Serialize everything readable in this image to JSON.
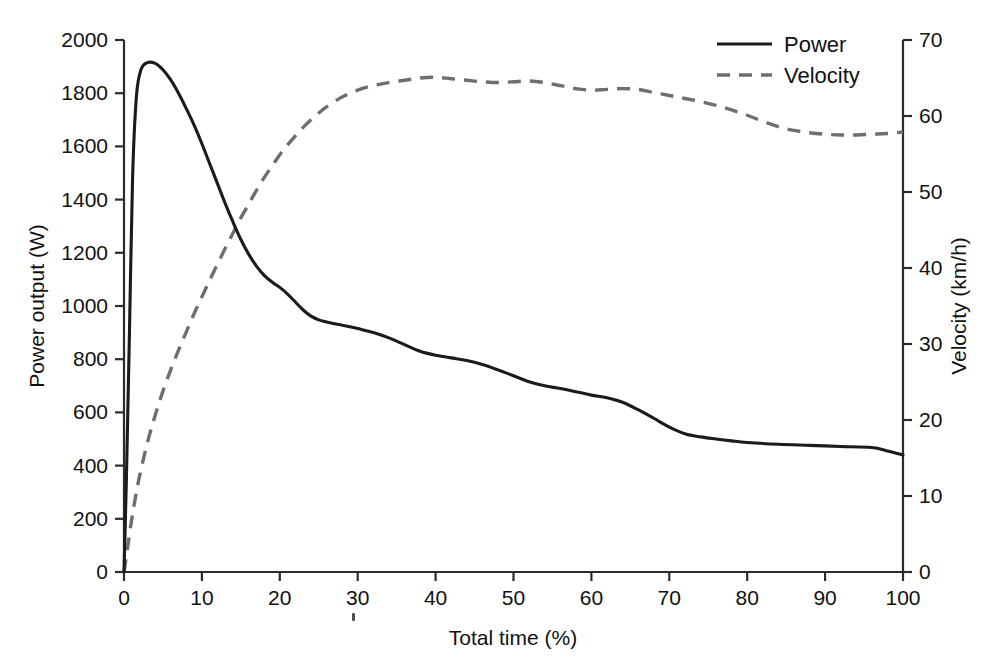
{
  "chart_data": {
    "type": "line",
    "title": "",
    "xlabel": "Total time (%)",
    "ylabel": "Power output (W)",
    "y2label": "Velocity (km/h)",
    "xlim": [
      0,
      100
    ],
    "ylim": [
      0,
      2000
    ],
    "y2lim": [
      0,
      70
    ],
    "grid": false,
    "legend_position": "top-right",
    "xticks": [
      0,
      10,
      20,
      30,
      40,
      50,
      60,
      70,
      80,
      90,
      100
    ],
    "xticklabels": [
      "0",
      "10",
      "20",
      "30",
      "40",
      "50",
      "60",
      "70",
      "80",
      "90",
      "100"
    ],
    "yticks": [
      0,
      200,
      400,
      600,
      800,
      1000,
      1200,
      1400,
      1600,
      1800,
      2000
    ],
    "yticklabels": [
      "0",
      "200",
      "400",
      "600",
      "800",
      "1000",
      "1200",
      "1400",
      "1600",
      "1800",
      "2000"
    ],
    "y2ticks": [
      0,
      10,
      20,
      30,
      40,
      50,
      60,
      70
    ],
    "y2ticklabels": [
      "0",
      "10",
      "20",
      "30",
      "40",
      "50",
      "60",
      "70"
    ],
    "series": [
      {
        "name": "Power",
        "axis": "left",
        "unit": "W",
        "style": "solid",
        "color": "#1b1b1b",
        "x": [
          0,
          0.3,
          0.7,
          1.1,
          1.6,
          2.2,
          3.0,
          4.0,
          5.0,
          6.0,
          7.0,
          8.0,
          9.0,
          10.0,
          11.0,
          12.0,
          13.0,
          14.0,
          15.0,
          16.0,
          17.0,
          18.0,
          19.0,
          20.0,
          21.0,
          22.0,
          23.0,
          24.0,
          25.0,
          26.0,
          27.0,
          28.0,
          29.0,
          30.0,
          32.0,
          34.0,
          36.0,
          38.0,
          40.0,
          42.0,
          44.0,
          46.0,
          48.0,
          50.0,
          52.0,
          54.0,
          56.0,
          58.0,
          60.0,
          62.0,
          64.0,
          66.0,
          68.0,
          70.0,
          72.0,
          74.0,
          76.0,
          78.0,
          80.0,
          84.0,
          88.0,
          92.0,
          96.0,
          98.0,
          100.0
        ],
        "y": [
          0,
          340,
          900,
          1480,
          1790,
          1890,
          1915,
          1912,
          1888,
          1850,
          1800,
          1742,
          1680,
          1610,
          1535,
          1460,
          1385,
          1315,
          1250,
          1195,
          1150,
          1115,
          1090,
          1070,
          1045,
          1015,
          985,
          962,
          948,
          940,
          933,
          928,
          922,
          915,
          900,
          880,
          855,
          830,
          815,
          805,
          795,
          780,
          760,
          738,
          715,
          700,
          690,
          678,
          665,
          655,
          638,
          610,
          578,
          545,
          520,
          508,
          500,
          493,
          487,
          480,
          476,
          472,
          468,
          455,
          440
        ]
      },
      {
        "name": "Velocity",
        "axis": "right",
        "unit": "km/h",
        "style": "dashed",
        "color": "#6e6e6e",
        "x": [
          0,
          0.5,
          1.0,
          1.5,
          2.0,
          3.0,
          4.0,
          5.0,
          6.0,
          7.0,
          8.0,
          9.0,
          10.0,
          11.0,
          12.0,
          13.0,
          14.0,
          15.0,
          16.0,
          17.0,
          18.0,
          19.0,
          20.0,
          21.0,
          22.0,
          23.0,
          24.0,
          25.0,
          26.0,
          28.0,
          30.0,
          32.0,
          34.0,
          36.0,
          38.0,
          40.0,
          42.0,
          44.0,
          46.0,
          48.0,
          50.0,
          52.0,
          54.0,
          56.0,
          58.0,
          60.0,
          62.0,
          64.0,
          66.0,
          68.0,
          70.0,
          72.0,
          74.0,
          76.0,
          78.0,
          80.0,
          82.0,
          84.0,
          86.0,
          88.0,
          90.0,
          92.0,
          94.0,
          96.0,
          98.0,
          100.0
        ],
        "y": [
          0,
          3.5,
          7.0,
          10.0,
          12.6,
          17.0,
          20.6,
          23.8,
          26.6,
          29.2,
          31.6,
          34.0,
          36.2,
          38.4,
          40.5,
          42.6,
          44.6,
          46.6,
          48.4,
          50.2,
          51.9,
          53.4,
          54.9,
          56.2,
          57.4,
          58.5,
          59.5,
          60.4,
          61.2,
          62.5,
          63.4,
          64.0,
          64.4,
          64.7,
          65.0,
          65.1,
          64.9,
          64.7,
          64.5,
          64.4,
          64.5,
          64.6,
          64.4,
          64.0,
          63.6,
          63.4,
          63.5,
          63.6,
          63.5,
          63.1,
          62.7,
          62.3,
          61.9,
          61.4,
          60.8,
          60.1,
          59.3,
          58.6,
          58.1,
          57.8,
          57.6,
          57.5,
          57.5,
          57.6,
          57.7,
          57.9
        ]
      }
    ]
  },
  "legend": {
    "items": [
      {
        "label": "Power",
        "style": "solid",
        "color": "#1b1b1b"
      },
      {
        "label": "Velocity",
        "style": "dashed",
        "color": "#6e6e6e"
      }
    ]
  },
  "axes": {
    "x_title": "Total time (%)",
    "y_left_title": "Power output (W)",
    "y_right_title": "Velocity (km/h)"
  },
  "colors": {
    "power": "#1b1b1b",
    "velocity": "#6e6e6e",
    "axis": "#2b2b2b",
    "background": "#ffffff"
  }
}
